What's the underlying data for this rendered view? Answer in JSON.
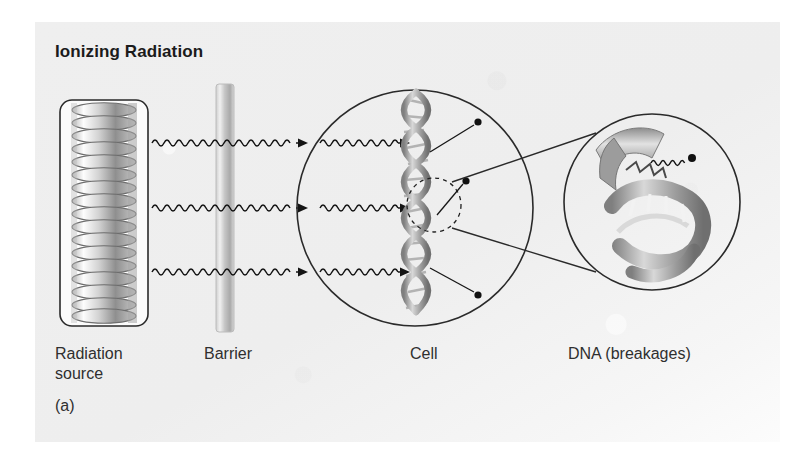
{
  "figure": {
    "title": "Ionizing Radiation",
    "panel_label": "(a)",
    "background_color": "#efefef",
    "ink_color": "#1b1b1b",
    "helix_color": "#9a9a9a"
  },
  "labels": {
    "radiation_source": "Radiation\nsource",
    "barrier": "Barrier",
    "cell": "Cell",
    "dna": "DNA (breakages)"
  },
  "diagram_data": {
    "type": "scientific-diagram",
    "subject": "Ionizing radiation damaging cellular DNA",
    "stages": [
      {
        "order": 1,
        "name": "radiation-source",
        "label": "Radiation source",
        "shape": "rounded-rectangle-with-coil",
        "coil_loops": 17,
        "x": 60,
        "y": 100,
        "width": 88,
        "height": 226
      },
      {
        "order": 2,
        "name": "barrier",
        "label": "Barrier",
        "shape": "vertical-gradient-bar",
        "x": 216,
        "y": 84,
        "width": 18,
        "height": 248
      },
      {
        "order": 3,
        "name": "cell",
        "label": "Cell",
        "shape": "circle",
        "center_x": 415,
        "center_y": 208,
        "radius": 118,
        "contains": "vertical-dna-double-helix"
      },
      {
        "order": 4,
        "name": "dna-inset",
        "label": "DNA (breakages)",
        "shape": "circle-magnifier",
        "center_x": 652,
        "center_y": 202,
        "radius": 88,
        "contains": "broken-dna-double-helix"
      }
    ],
    "rays": {
      "count": 3,
      "style": "sinusoidal-wave-with-arrowhead",
      "y_positions": [
        143,
        208,
        272
      ],
      "segments": [
        {
          "name": "source-to-barrier",
          "x_start": 152,
          "x_end": 292
        },
        {
          "name": "barrier-to-cell",
          "x_start": 300,
          "x_end": 396
        }
      ]
    },
    "damage_markers": {
      "count": 3,
      "description": "filled dots with leader lines marking DNA break sites",
      "points": [
        {
          "dot_x": 478,
          "dot_y": 122,
          "anchor_x": 430,
          "anchor_y": 152
        },
        {
          "dot_x": 466,
          "dot_y": 181,
          "anchor_x": 432,
          "anchor_y": 213
        },
        {
          "dot_x": 478,
          "dot_y": 295,
          "anchor_x": 430,
          "anchor_y": 268
        }
      ]
    },
    "highlight_circle": {
      "style": "dashed",
      "center_x": 434,
      "center_y": 205,
      "radius": 27
    },
    "magnifier_leaders": [
      {
        "x1": 452,
        "y1": 186,
        "x2": 590,
        "y2": 137
      },
      {
        "x1": 452,
        "y1": 222,
        "x2": 590,
        "y2": 268
      }
    ],
    "inset_ray": {
      "description": "small wavy ray ending in a dot striking the break",
      "x_start": 651,
      "x_end": 690,
      "y": 160
    }
  }
}
